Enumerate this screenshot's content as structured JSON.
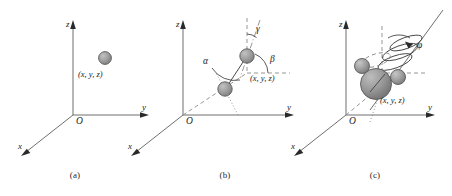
{
  "figure": {
    "panels": [
      {
        "id": "a",
        "caption": "(a)",
        "origin_label": "O",
        "axes": [
          {
            "name": "z",
            "label": "z"
          },
          {
            "name": "y",
            "label": "y"
          },
          {
            "name": "x",
            "label": "x"
          }
        ],
        "particle": {
          "label": "(x,  y,  z)",
          "count": 1,
          "color": "#9a9a9a"
        },
        "angles": []
      },
      {
        "id": "b",
        "caption": "(b)",
        "origin_label": "O",
        "axes": [
          {
            "name": "z",
            "label": "z"
          },
          {
            "name": "y",
            "label": "y"
          },
          {
            "name": "x",
            "label": "x"
          }
        ],
        "particle": {
          "label": "(x,  y,  z)",
          "count": 2,
          "color": "#9a9a9a"
        },
        "angles": [
          {
            "name": "alpha",
            "label": "α"
          },
          {
            "name": "beta",
            "label": "β"
          },
          {
            "name": "gamma",
            "label": "γ"
          }
        ]
      },
      {
        "id": "c",
        "caption": "(c)",
        "origin_label": "O",
        "axes": [
          {
            "name": "z",
            "label": "z"
          },
          {
            "name": "y",
            "label": "y"
          },
          {
            "name": "x",
            "label": "x"
          }
        ],
        "particle": {
          "label": "(x,  y,  z)",
          "count": 4,
          "color": "#9a9a9a"
        },
        "angles": [
          {
            "name": "phi",
            "label": "φ"
          }
        ]
      }
    ],
    "colors": {
      "sphere_fill": "#9a9a9a",
      "sphere_stroke": "#5a5a5a",
      "axis": "#6f6f6f",
      "dash": "#8a8a8a",
      "text": "#1c1c1c",
      "background": "#ffffff"
    }
  }
}
